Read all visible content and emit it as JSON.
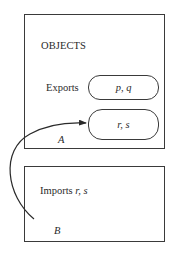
{
  "diagram": {
    "module_a": {
      "title": "OBJECTS",
      "exports_label": "Exports",
      "exported_items": "p, q",
      "secondary_items": "r, s",
      "name": "A"
    },
    "module_b": {
      "imports_label": "Imports ",
      "imported_items": "r, s",
      "name": "B"
    },
    "arrow": {
      "from": "B",
      "to": "r, s",
      "meaning": "imports"
    },
    "colors": {
      "line": "#3a3a3a",
      "text": "#2a2a2a",
      "background": "#ffffff"
    }
  }
}
